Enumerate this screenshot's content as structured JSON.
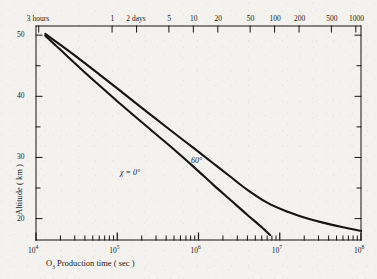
{
  "chart_data": {
    "type": "line",
    "title": "",
    "xlabel": "O₃ Production time ( sec )",
    "ylabel": "Altitude ( km )",
    "xscale": "log",
    "xlim": [
      10000,
      100000000
    ],
    "ylim": [
      16.5,
      51.5
    ],
    "yticks_major": [
      50,
      40,
      30,
      20
    ],
    "yticks_minor": [
      45,
      35,
      25
    ],
    "xticks_major_labels": [
      "10",
      "10",
      "10",
      "10",
      "10"
    ],
    "xticks_major_exponents": [
      "4",
      "5",
      "6",
      "7",
      "8"
    ],
    "grid": false,
    "legend": "inline-labels",
    "secondary_axis": {
      "position": "top",
      "label": "",
      "ticks": [
        {
          "label": "3 hours",
          "seconds": 10800
        },
        {
          "label": "1",
          "seconds": 86400
        },
        {
          "label": "2 days",
          "seconds": 172800
        },
        {
          "label": "5",
          "seconds": 432000
        },
        {
          "label": "10",
          "seconds": 864000
        },
        {
          "label": "20",
          "seconds": 1728000
        },
        {
          "label": "50",
          "seconds": 4320000
        },
        {
          "label": "100",
          "seconds": 8640000
        },
        {
          "label": "200",
          "seconds": 17280000
        },
        {
          "label": "500",
          "seconds": 43200000
        },
        {
          "label": "1000",
          "seconds": 86400000
        }
      ]
    },
    "series": [
      {
        "name": "χ = 0°",
        "label": "χ = 0°",
        "label_x": 120,
        "label_y": 169,
        "points": [
          [
            13000,
            49.9
          ],
          [
            20000,
            47.6
          ],
          [
            35000,
            44.6
          ],
          [
            60000,
            41.8
          ],
          [
            100000,
            39.2
          ],
          [
            180000,
            36.3
          ],
          [
            300000,
            33.8
          ],
          [
            500000,
            31.3
          ],
          [
            900000,
            28.3
          ],
          [
            1500000,
            25.6
          ],
          [
            2500000,
            23.0
          ],
          [
            4000000,
            20.6
          ],
          [
            6000000,
            18.6
          ],
          [
            7600000,
            17.3
          ]
        ]
      },
      {
        "name": "60°",
        "label": "60°",
        "label_x": 191,
        "label_y": 157,
        "points": [
          [
            13000,
            50.2
          ],
          [
            20000,
            48.4
          ],
          [
            35000,
            46.0
          ],
          [
            60000,
            43.6
          ],
          [
            100000,
            41.3
          ],
          [
            180000,
            38.6
          ],
          [
            300000,
            36.3
          ],
          [
            500000,
            34.0
          ],
          [
            900000,
            31.4
          ],
          [
            1500000,
            29.1
          ],
          [
            2500000,
            26.8
          ],
          [
            4000000,
            24.7
          ],
          [
            7000000,
            22.6
          ],
          [
            12000000,
            21.2
          ],
          [
            20000000,
            20.2
          ],
          [
            35000000,
            19.3
          ],
          [
            60000000,
            18.6
          ],
          [
            100000000,
            18.0
          ]
        ]
      }
    ]
  },
  "style": {
    "ink": "#141414",
    "paper": "#f4f2ee",
    "curve_width": 2.1,
    "axis_width": 1.0
  }
}
